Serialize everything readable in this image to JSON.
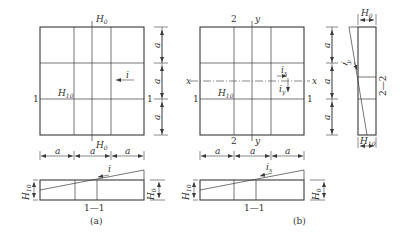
{
  "figure": {
    "panels": [
      {
        "id": "a",
        "caption": "(a)",
        "plan": {
          "top_label": "H",
          "top_label_sub": "0",
          "bottom_label": "H",
          "bottom_label_sub": "0",
          "inner_label": "H",
          "inner_label_sub": "10",
          "section_mark_left": "1",
          "section_mark_right": "1",
          "slope_label": "i",
          "dim_label": "a"
        },
        "section": {
          "title": "1—1",
          "left_height": "H",
          "left_height_sub": "10",
          "right_height": "H",
          "right_height_sub": "0",
          "slope_label": "i"
        }
      },
      {
        "id": "b",
        "caption": "(b)",
        "plan": {
          "top_mark": "2",
          "bottom_mark": "2",
          "axis_y_top": "y",
          "axis_y_bottom": "y",
          "axis_x_left": "x",
          "axis_x_right": "x",
          "inner_label": "H",
          "inner_label_sub": "10",
          "section_mark_left": "1",
          "section_mark_right": "1",
          "slope_x_label": "i",
          "slope_x_sub": "x",
          "slope_y_label": "i",
          "slope_y_sub": "y",
          "dim_label": "a"
        },
        "section": {
          "title": "1—1",
          "left_height": "H",
          "left_height_sub": "10",
          "right_height": "H",
          "right_height_sub": "0",
          "slope_label": "i",
          "slope_sub": "x"
        },
        "side_section": {
          "title": "2—2",
          "top_width": "H",
          "top_width_sub": "0",
          "bottom_width": "H",
          "bottom_width_sub": "10",
          "slope_label": "i",
          "slope_sub": "y",
          "dim_label": "a"
        }
      }
    ]
  }
}
